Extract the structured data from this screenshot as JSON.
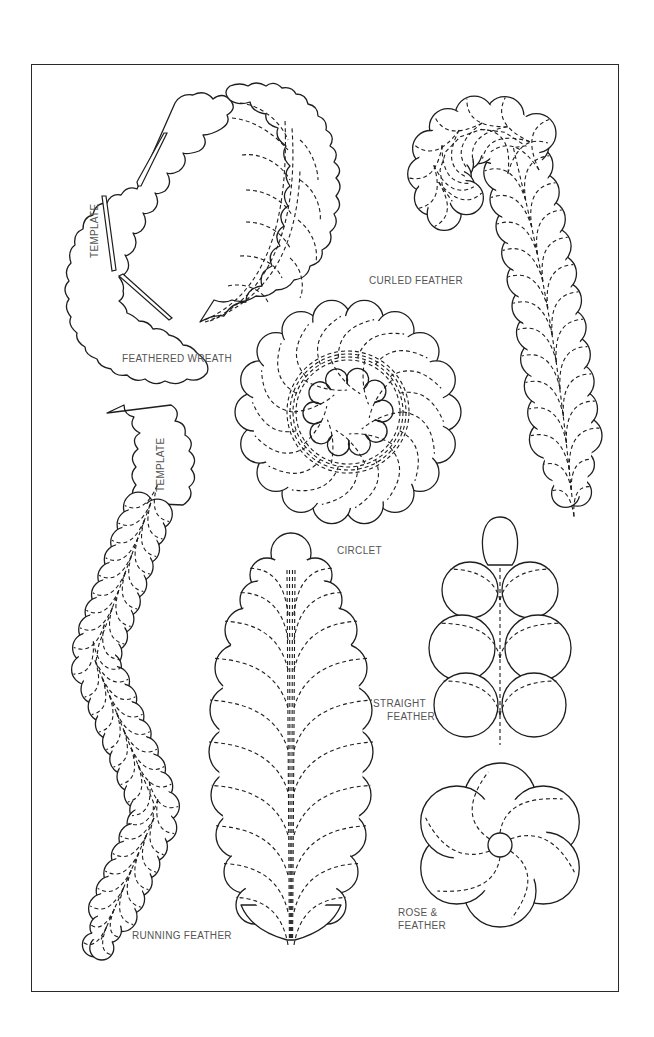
{
  "page": {
    "background": "#ffffff",
    "ink_color": "#1e1e1e",
    "label_color": "#555555"
  },
  "patterns": [
    {
      "id": "feathered-wreath",
      "label": "FEATHERED WREATH",
      "template_label": "TEMPLATE"
    },
    {
      "id": "curled-feather",
      "label": "CURLED FEATHER"
    },
    {
      "id": "circlet",
      "label": "CIRCLET"
    },
    {
      "id": "running-feather",
      "label": "RUNNING FEATHER",
      "template_label": "TEMPLATE"
    },
    {
      "id": "straight-feather",
      "label_line1": "STRAIGHT",
      "label_line2": "FEATHER"
    },
    {
      "id": "rose-and-feather",
      "label_line1": "ROSE &",
      "label_line2": "FEATHER"
    }
  ]
}
